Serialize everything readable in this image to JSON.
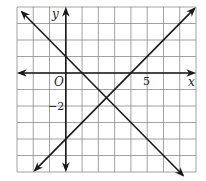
{
  "chart_data": {
    "type": "line",
    "title": "",
    "xlabel": "x",
    "ylabel": "y",
    "origin_label": "O",
    "xlim": [
      -3,
      8
    ],
    "ylim": [
      -6,
      4
    ],
    "grid": true,
    "tick_labels": [
      {
        "axis": "x",
        "value": 5,
        "text": "5"
      },
      {
        "axis": "y",
        "value": -2,
        "text": "−2"
      }
    ],
    "series": [
      {
        "name": "line-1",
        "equation": "y = -x + 1",
        "points": [
          [
            -3,
            4
          ],
          [
            8,
            -7
          ]
        ]
      },
      {
        "name": "line-2",
        "equation": "y = x - 4",
        "points": [
          [
            -2,
            -6
          ],
          [
            8,
            4
          ]
        ]
      }
    ],
    "intersection": [
      2.5,
      -1.5
    ],
    "line_color": "#1a1a1a",
    "grid_color": "#8a8a8a"
  }
}
